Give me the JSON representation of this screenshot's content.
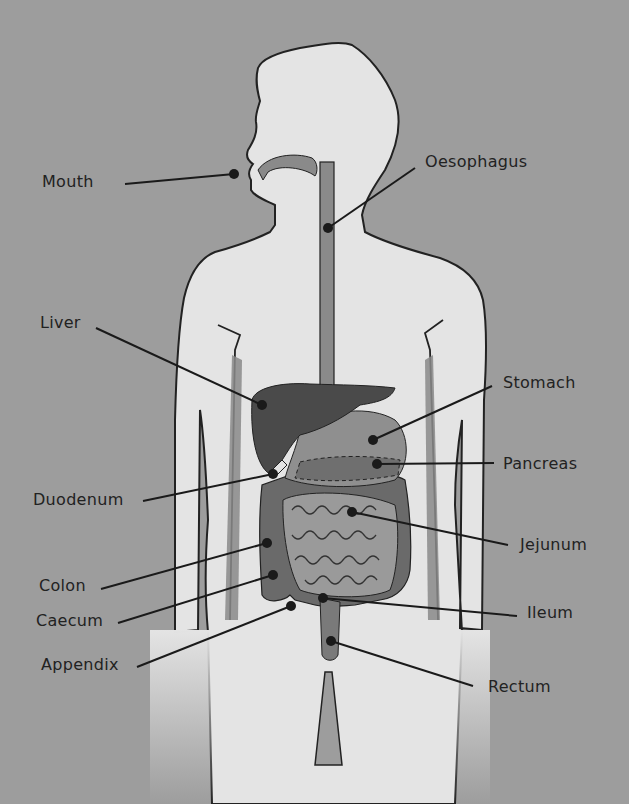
{
  "diagram": {
    "colors": {
      "background": "#9d9d9d",
      "body": "#e4e4e4",
      "outline": "#222222",
      "tract": "#8a8a8a",
      "liver": "#4a4a4a",
      "stomach": "#8f8f8f",
      "colon": "#6a6a6a",
      "small_intestine": "#9a9a9a"
    },
    "labels": [
      {
        "id": "mouth",
        "text": "Mouth",
        "x": 42,
        "y": 172,
        "line": [
          125,
          184,
          234,
          174
        ]
      },
      {
        "id": "oesophagus",
        "text": "Oesophagus",
        "x": 425,
        "y": 152,
        "line": [
          415,
          168,
          328,
          228
        ]
      },
      {
        "id": "liver",
        "text": "Liver",
        "x": 40,
        "y": 313,
        "line": [
          96,
          328,
          262,
          405
        ]
      },
      {
        "id": "stomach",
        "text": "Stomach",
        "x": 503,
        "y": 373,
        "line": [
          492,
          386,
          373,
          440
        ]
      },
      {
        "id": "pancreas",
        "text": "Pancreas",
        "x": 503,
        "y": 454,
        "line": [
          494,
          463,
          377,
          464
        ]
      },
      {
        "id": "duodenum",
        "text": "Duodenum",
        "x": 33,
        "y": 490,
        "line": [
          143,
          501,
          273,
          474
        ]
      },
      {
        "id": "jejunum",
        "text": "Jejunum",
        "x": 520,
        "y": 535,
        "line": [
          508,
          545,
          352,
          512
        ]
      },
      {
        "id": "colon",
        "text": "Colon",
        "x": 39,
        "y": 576,
        "line": [
          101,
          589,
          267,
          543
        ]
      },
      {
        "id": "caecum",
        "text": "Caecum",
        "x": 36,
        "y": 611,
        "line": [
          118,
          623,
          273,
          575
        ]
      },
      {
        "id": "ileum",
        "text": "Ileum",
        "x": 527,
        "y": 603,
        "line": [
          517,
          616,
          323,
          598
        ]
      },
      {
        "id": "appendix",
        "text": "Appendix",
        "x": 41,
        "y": 655,
        "line": [
          137,
          667,
          291,
          606
        ]
      },
      {
        "id": "rectum",
        "text": "Rectum",
        "x": 488,
        "y": 677,
        "line": [
          473,
          686,
          331,
          641
        ]
      }
    ]
  }
}
